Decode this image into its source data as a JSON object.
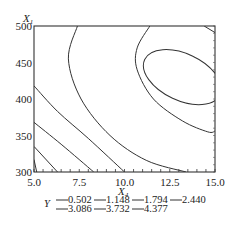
{
  "chart_data": {
    "type": "contour",
    "title": "",
    "xlabel": "X",
    "xlabel_sub": "4",
    "ylabel": "X",
    "ylabel_sub": "1",
    "xlim": [
      5.0,
      15.0
    ],
    "ylim": [
      300,
      500
    ],
    "xticks": [
      "5.0",
      "7.5",
      "10.0",
      "12.5",
      "15.0"
    ],
    "xtick_values": [
      5.0,
      7.5,
      10.0,
      12.5,
      15.0
    ],
    "yticks": [
      "300",
      "350",
      "400",
      "450",
      "500"
    ],
    "ytick_values": [
      300,
      350,
      400,
      450,
      500
    ],
    "response_label": "Y",
    "levels": [
      0.502,
      1.148,
      1.794,
      2.44,
      3.086,
      3.732,
      4.377
    ],
    "legend_rows": [
      [
        "0.502",
        "1.148",
        "1.794",
        "2.440"
      ],
      [
        "3.086",
        "3.732",
        "4.377"
      ]
    ],
    "contours": [
      {
        "level": 0.502,
        "points": [
          [
            5.0,
            317
          ],
          [
            5.15,
            300
          ]
        ]
      },
      {
        "level": 1.148,
        "points": [
          [
            5.0,
            335
          ],
          [
            6.3,
            300
          ]
        ]
      },
      {
        "level": 1.794,
        "points": [
          [
            5.0,
            368
          ],
          [
            6.5,
            338
          ],
          [
            8.3,
            300
          ]
        ]
      },
      {
        "level": 2.44,
        "points": [
          [
            5.0,
            418
          ],
          [
            6.3,
            383
          ],
          [
            8.0,
            346
          ],
          [
            10.0,
            300
          ]
        ]
      },
      {
        "level": 3.086,
        "points": [
          [
            7.4,
            500
          ],
          [
            6.9,
            455
          ],
          [
            7.6,
            400
          ],
          [
            9.2,
            350
          ],
          [
            11.2,
            316
          ],
          [
            13.4,
            300
          ]
        ]
      },
      {
        "level": 3.732,
        "points": [
          [
            11.4,
            500
          ],
          [
            10.7,
            470
          ],
          [
            10.7,
            440
          ],
          [
            11.6,
            400
          ],
          [
            13.2,
            370
          ],
          [
            14.6,
            355
          ],
          [
            15.0,
            356
          ]
        ]
      },
      {
        "level": 4.377,
        "ellipse": {
          "cx": 13.2,
          "cy": 430,
          "rx": 2.3,
          "ry": 32,
          "rotate_deg": 25
        }
      },
      {
        "level": 4.377,
        "points": [
          [
            14.4,
            500
          ],
          [
            15.0,
            491
          ]
        ]
      }
    ]
  }
}
